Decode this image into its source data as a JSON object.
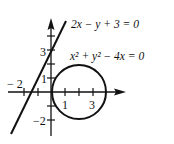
{
  "figure": {
    "line_equation": "2x − y + 3 = 0",
    "circle_equation": "x² + y² − 4x = 0",
    "x_tick_labels": {
      "neg2": "− 2",
      "one": "1",
      "three": "3"
    },
    "y_tick_labels": {
      "three": "3",
      "one": "1",
      "neg2": "−2"
    },
    "colors": {
      "stroke": "#111111",
      "background": "#ffffff"
    }
  }
}
